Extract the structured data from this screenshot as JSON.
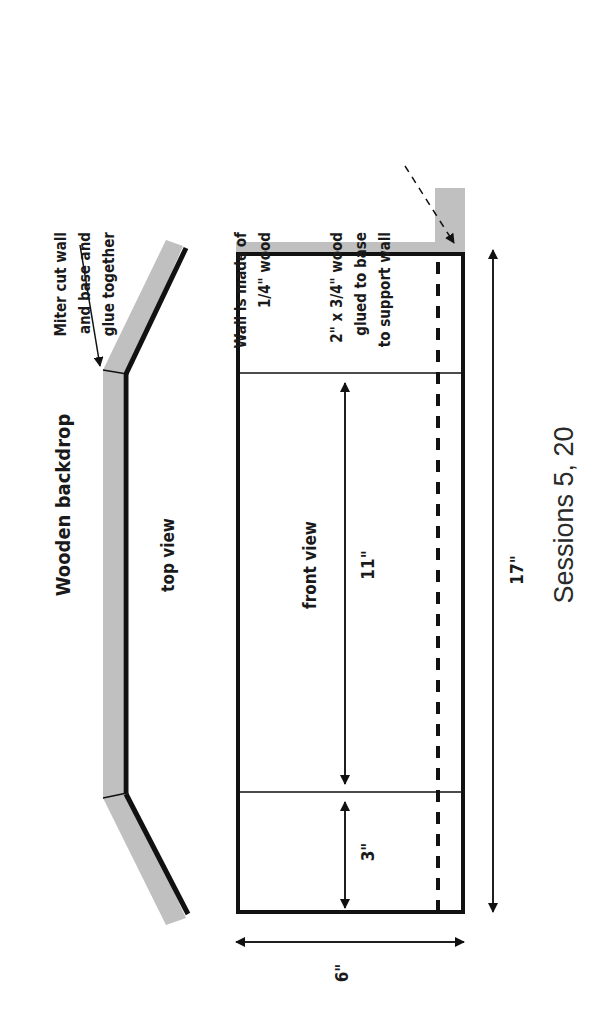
{
  "diagram": {
    "title": "Wooden backdrop",
    "caption": "Sessions 5, 20",
    "orientation": "rotated 90 degrees counter-clockwise",
    "colors": {
      "wood": "#c0c0c0",
      "line": "#111111"
    },
    "top_view": {
      "label": "top view",
      "annotation_lines": [
        "Miter cut wall",
        "and base and",
        "glue together"
      ]
    },
    "front_view": {
      "label": "front view",
      "wall_note_lines": [
        "Wall is made of",
        "1/4\" wood"
      ],
      "support_note_lines": [
        "2\" x 3/4\" wood",
        "glued to base",
        "to support wall"
      ]
    },
    "dimensions": {
      "height": "6\"",
      "length": "17\"",
      "center_panel": "11\"",
      "side_panel": "3\""
    }
  }
}
